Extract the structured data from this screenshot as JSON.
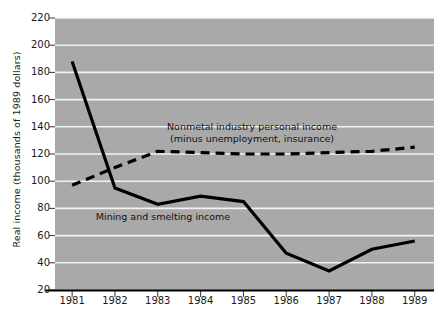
{
  "chart_data": {
    "type": "line",
    "title": "",
    "xlabel": "",
    "ylabel": "Real income (thousands of 1989 dollars)",
    "x": [
      1981,
      1982,
      1983,
      1984,
      1985,
      1986,
      1987,
      1988,
      1989
    ],
    "categories": [
      "1981",
      "1982",
      "1983",
      "1984",
      "1985",
      "1986",
      "1987",
      "1988",
      "1989"
    ],
    "xtick_labels": [
      "1981",
      "1982",
      "1983",
      "1984",
      "1985",
      "1986",
      "1987",
      "1988",
      "1989"
    ],
    "ytick_labels": [
      "20",
      "40",
      "60",
      "80",
      "100",
      "120",
      "140",
      "160",
      "180",
      "200",
      "220"
    ],
    "ytick_values": [
      20,
      40,
      60,
      80,
      100,
      120,
      140,
      160,
      180,
      200,
      220
    ],
    "ylim": [
      20,
      220
    ],
    "xlim": [
      1980.6,
      1989.45
    ],
    "grid": "horizontal-white",
    "legend": "inline-annotations",
    "plot_bgcolor": "#a9a9a9",
    "gridline_color": "#f2f2f2",
    "line_color": "#000000",
    "series": [
      {
        "name": "Mining and smelting income",
        "style": "solid",
        "values": [
          188,
          95,
          83,
          89,
          85,
          47,
          34,
          50,
          56
        ]
      },
      {
        "name": "Nonmetal industry personal income (minus unemployment, insurance)",
        "style": "dashed",
        "values": [
          97,
          110,
          122,
          121,
          120,
          120,
          121,
          122,
          125
        ]
      }
    ],
    "annotations": [
      {
        "id": "nonmetal-label",
        "line1": "Nonmetal industry personal income",
        "line2": "(minus unemployment, insurance)"
      },
      {
        "id": "mining-label",
        "line1": "Mining and smelting income"
      }
    ]
  }
}
